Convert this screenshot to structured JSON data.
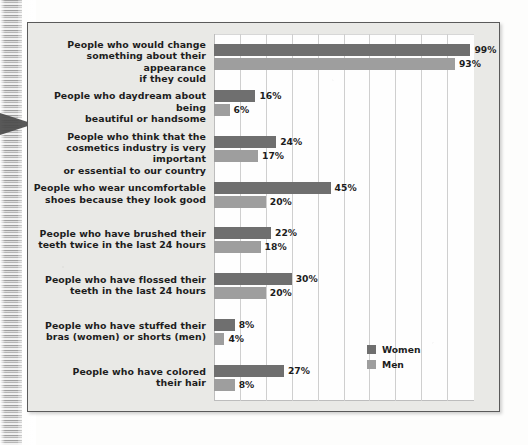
{
  "chart_data": {
    "type": "bar",
    "orientation": "horizontal",
    "title": "",
    "xlabel": "",
    "ylabel": "",
    "xlim": [
      0,
      100
    ],
    "grid": true,
    "grid_step": 10,
    "legend_position": "bottom-right-inside-plot",
    "value_suffix": "%",
    "categories": [
      "People who would change something about their appearance if they could",
      "People who daydream about being beautiful or handsome",
      "People who think that the cosmetics industry is very important or essential to our country",
      "People who wear uncomfortable shoes because they look good",
      "People who have brushed their teeth twice in the last 24 hours",
      "People who have flossed their teeth in the last 24 hours",
      "People who have stuffed their bras (women) or shorts (men)",
      "People who have colored their hair"
    ],
    "series": [
      {
        "name": "Women",
        "color": "#6f6f6f",
        "values": [
          99,
          16,
          24,
          45,
          22,
          30,
          8,
          27
        ]
      },
      {
        "name": "Men",
        "color": "#9e9e9e",
        "values": [
          93,
          6,
          17,
          20,
          18,
          20,
          4,
          8
        ]
      }
    ]
  },
  "groups": [
    {
      "label_lines": [
        "People who would change",
        "something about their appearance",
        "if they could"
      ],
      "women": {
        "value": 99,
        "label": "99%"
      },
      "men": {
        "value": 93,
        "label": "93%"
      }
    },
    {
      "label_lines": [
        "People who daydream about being",
        "beautiful or handsome"
      ],
      "women": {
        "value": 16,
        "label": "16%"
      },
      "men": {
        "value": 6,
        "label": "6%"
      }
    },
    {
      "label_lines": [
        "People who think that the",
        "cosmetics industry is very important",
        "or essential to our country"
      ],
      "women": {
        "value": 24,
        "label": "24%"
      },
      "men": {
        "value": 17,
        "label": "17%"
      }
    },
    {
      "label_lines": [
        "People who wear uncomfortable",
        "shoes because they look good"
      ],
      "women": {
        "value": 45,
        "label": "45%"
      },
      "men": {
        "value": 20,
        "label": "20%"
      }
    },
    {
      "label_lines": [
        "People who have brushed their",
        "teeth twice in the last 24 hours"
      ],
      "women": {
        "value": 22,
        "label": "22%"
      },
      "men": {
        "value": 18,
        "label": "18%"
      }
    },
    {
      "label_lines": [
        "People who have flossed their",
        "teeth in the last 24 hours"
      ],
      "women": {
        "value": 30,
        "label": "30%"
      },
      "men": {
        "value": 20,
        "label": "20%"
      }
    },
    {
      "label_lines": [
        "People who have stuffed their",
        "bras (women) or shorts (men)"
      ],
      "women": {
        "value": 8,
        "label": "8%"
      },
      "men": {
        "value": 4,
        "label": "4%"
      }
    },
    {
      "label_lines": [
        "People who have colored",
        "their hair"
      ],
      "women": {
        "value": 27,
        "label": "27%"
      },
      "men": {
        "value": 8,
        "label": "8%"
      }
    }
  ],
  "legend": {
    "items": [
      {
        "key": "women",
        "label": "Women",
        "color": "#6f6f6f"
      },
      {
        "key": "men",
        "label": "Men",
        "color": "#9e9e9e"
      }
    ]
  },
  "colors": {
    "women": "#6f6f6f",
    "men": "#9e9e9e",
    "frame_background": "#e9e9e6",
    "frame_border": "#5a5a5a",
    "plot_background": "#fefefe",
    "gridline": "#cfcfcf",
    "text": "#1d1d1d"
  }
}
